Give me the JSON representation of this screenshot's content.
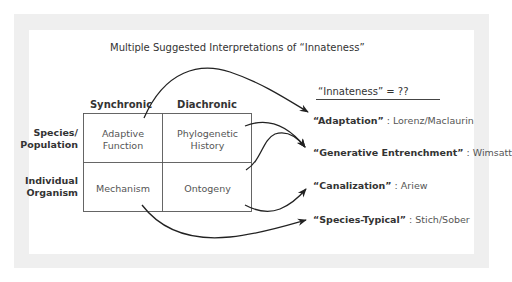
{
  "diagram": {
    "title": "Multiple Suggested Interpretations of “Innateness”",
    "columns": [
      "Synchronic",
      "Diachronic"
    ],
    "rows": [
      {
        "label_line1": "Species/",
        "label_line2": "Population",
        "cells": [
          {
            "line1": "Adaptive",
            "line2": "Function"
          },
          {
            "line1": "Phylogenetic",
            "line2": "History"
          }
        ]
      },
      {
        "label_line1": "Individual",
        "label_line2": "Organism",
        "cells": [
          {
            "line1": "Mechanism",
            "line2": ""
          },
          {
            "line1": "Ontogeny",
            "line2": ""
          }
        ]
      }
    ],
    "definitions_header": "“Innateness” = ??",
    "definitions": [
      {
        "term": "“Adaptation”",
        "author": " : Lorenz/Maclaurin"
      },
      {
        "term": "“Generative Entrenchment”",
        "author": " : Wimsatt"
      },
      {
        "term": "“Canalization”",
        "author": " : Ariew"
      },
      {
        "term": "“Species-Typical”",
        "author": " : Stich/Sober"
      }
    ],
    "arrows": [
      {
        "from": "Adaptive Function",
        "to": "Adaptation"
      },
      {
        "from": "Phylogenetic History",
        "to": "Generative Entrenchment"
      },
      {
        "from": "Ontogeny",
        "to": "Generative Entrenchment"
      },
      {
        "from": "Ontogeny",
        "to": "Canalization"
      },
      {
        "from": "Mechanism",
        "to": "Species-Typical"
      }
    ],
    "colors": {
      "frame": "#efefef",
      "lines": "#222222",
      "grid": "#555555"
    }
  }
}
